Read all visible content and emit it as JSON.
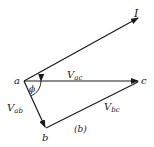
{
  "diagram": {
    "type": "phasor-diagram",
    "caption": "(b)",
    "points": {
      "a": {
        "label": "a"
      },
      "b": {
        "label": "b"
      },
      "c": {
        "label": "c"
      }
    },
    "vectors": [
      {
        "id": "I",
        "label": "I",
        "sub": ""
      },
      {
        "id": "Vac",
        "label": "V",
        "sub": "ac"
      },
      {
        "id": "Vab",
        "label": "V",
        "sub": "ab"
      },
      {
        "id": "Vbc",
        "label": "V",
        "sub": "bc"
      }
    ],
    "angle": {
      "label": "ϕ"
    },
    "colors": {
      "ink": "#1a1a1a",
      "background": "#ffffff"
    }
  }
}
